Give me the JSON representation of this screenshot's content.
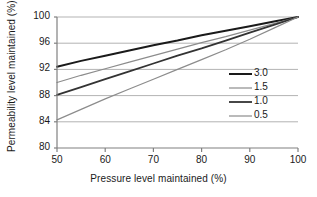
{
  "chart_data": {
    "type": "line",
    "title": "",
    "xlabel": "Pressure level maintained (%)",
    "ylabel": "Permeability level maintained (%)",
    "xlim": [
      50,
      100
    ],
    "ylim": [
      80,
      100
    ],
    "xticks": [
      50,
      60,
      70,
      80,
      90,
      100
    ],
    "yticks": [
      80,
      84,
      88,
      92,
      96,
      100
    ],
    "grid": "horizontal",
    "legend_position": "right-inside",
    "x": [
      50,
      55,
      60,
      65,
      70,
      75,
      80,
      85,
      90,
      95,
      100
    ],
    "series": [
      {
        "name": "3.0",
        "color": "#1a1a1a",
        "width": 2.0,
        "values": [
          92.4,
          93.3,
          94.1,
          94.9,
          95.7,
          96.4,
          97.2,
          97.9,
          98.6,
          99.3,
          100.0
        ]
      },
      {
        "name": "1.5",
        "color": "#8c8c8c",
        "width": 1.2,
        "values": [
          90.0,
          91.1,
          92.1,
          93.1,
          94.1,
          95.1,
          96.1,
          97.0,
          98.0,
          99.0,
          100.0
        ]
      },
      {
        "name": "1.0",
        "color": "#333333",
        "width": 1.8,
        "values": [
          88.1,
          89.3,
          90.5,
          91.7,
          92.9,
          94.1,
          95.2,
          96.4,
          97.6,
          98.8,
          100.0
        ]
      },
      {
        "name": "0.5",
        "color": "#8c8c8c",
        "width": 1.2,
        "values": [
          84.3,
          85.9,
          87.5,
          89.0,
          90.5,
          92.0,
          93.5,
          95.0,
          96.6,
          98.3,
          100.0
        ]
      }
    ]
  },
  "axes": {
    "x_title": "Pressure level maintained (%)",
    "y_title": "Permeability level maintained (%)",
    "x_tick_labels": [
      "50",
      "60",
      "70",
      "80",
      "90",
      "100"
    ],
    "y_tick_labels": [
      "80",
      "84",
      "88",
      "92",
      "96",
      "100"
    ]
  },
  "legend": {
    "items": [
      {
        "label": "3.0"
      },
      {
        "label": "1.5"
      },
      {
        "label": "1.0"
      },
      {
        "label": "0.5"
      }
    ]
  },
  "colors": {
    "axis": "#808080",
    "grid": "#b3b3b3",
    "text": "#1a1a1a",
    "series_dark": "#1a1a1a",
    "series_gray": "#8c8c8c"
  }
}
